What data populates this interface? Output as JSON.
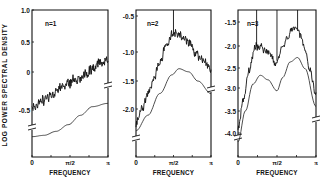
{
  "chart_data": [
    {
      "type": "line",
      "panel_label": "n=1",
      "xlabel": "FREQUENCY",
      "ylabel": "LOG POWER SPECTRAL DENSITY",
      "x_ticks": [
        "0",
        "π/2",
        "π"
      ],
      "y_ticks": [
        "1.0",
        "0.5",
        "0",
        "-0.5"
      ],
      "ylim": [
        -0.75,
        1.0
      ],
      "series": [
        {
          "name": "estimated spectrum (noisy)",
          "x": [
            0,
            0.25,
            0.5,
            0.75,
            1.0,
            1.25,
            1.5,
            1.75,
            2.0,
            2.25,
            2.5,
            2.75,
            3.14
          ],
          "values": [
            -0.45,
            -0.42,
            -0.35,
            -0.28,
            -0.22,
            -0.15,
            -0.1,
            -0.05,
            0.0,
            0.05,
            0.1,
            0.18,
            0.28
          ]
        },
        {
          "name": "theoretical spectrum (smooth, offset)",
          "x": [
            0,
            0.5,
            1.0,
            1.5,
            2.0,
            2.5,
            3.14
          ],
          "values": [
            -0.9,
            -0.88,
            -0.82,
            -0.72,
            -0.58,
            -0.45,
            -0.4
          ]
        }
      ],
      "vertical_markers": []
    },
    {
      "type": "line",
      "panel_label": "n=2",
      "xlabel": "FREQUENCY",
      "x_ticks": [
        "0",
        "π/2",
        "π"
      ],
      "y_ticks": [
        "-0.5",
        "-1.0",
        "-1.5",
        "-2.0"
      ],
      "ylim": [
        -2.4,
        -0.45
      ],
      "series": [
        {
          "name": "estimated spectrum (noisy)",
          "x": [
            0,
            0.25,
            0.5,
            0.75,
            1.0,
            1.25,
            1.5,
            1.75,
            2.0,
            2.25,
            2.5,
            2.75,
            3.14
          ],
          "values": [
            -2.25,
            -2.0,
            -1.75,
            -1.5,
            -1.25,
            -1.0,
            -0.8,
            -0.78,
            -0.85,
            -0.95,
            -1.1,
            -1.2,
            -1.35
          ]
        },
        {
          "name": "theoretical spectrum (smooth, offset)",
          "x": [
            0,
            0.5,
            1.0,
            1.5,
            1.8,
            2.2,
            2.6,
            3.14
          ],
          "values": [
            -2.35,
            -2.1,
            -1.75,
            -1.45,
            -1.35,
            -1.4,
            -1.55,
            -1.75
          ]
        }
      ],
      "vertical_markers": [
        1.57
      ]
    },
    {
      "type": "line",
      "panel_label": "n=3",
      "xlabel": "FREQUENCY",
      "x_ticks": [
        "0",
        "π/2",
        "π"
      ],
      "y_ticks": [
        "-1.5",
        "-2.0",
        "-2.5",
        "-3.0",
        "-3.5",
        "-4.0"
      ],
      "ylim": [
        -4.3,
        -1.4
      ],
      "series": [
        {
          "name": "estimated spectrum (noisy)",
          "x": [
            0,
            0.2,
            0.45,
            0.7,
            0.9,
            1.1,
            1.3,
            1.5,
            1.6,
            1.75,
            2.0,
            2.2,
            2.35,
            2.5,
            2.7,
            2.9,
            3.14
          ],
          "values": [
            -3.9,
            -3.3,
            -2.6,
            -2.05,
            -2.05,
            -2.15,
            -2.2,
            -2.45,
            -2.35,
            -2.1,
            -1.85,
            -1.65,
            -1.6,
            -1.8,
            -2.1,
            -2.6,
            -3.1
          ]
        },
        {
          "name": "theoretical spectrum (smooth, offset)",
          "x": [
            0,
            0.3,
            0.6,
            0.9,
            1.2,
            1.57,
            1.8,
            2.1,
            2.4,
            2.7,
            3.14
          ],
          "values": [
            -4.2,
            -3.5,
            -2.9,
            -2.7,
            -2.8,
            -3.05,
            -2.75,
            -2.4,
            -2.3,
            -2.55,
            -3.4
          ]
        }
      ],
      "vertical_markers": [
        0.75,
        1.57,
        2.4
      ]
    }
  ],
  "layout": {
    "panels": [
      {
        "x0": 32,
        "x1": 108,
        "y0": 10,
        "y1": 157,
        "tick_y": [
          10,
          42,
          72,
          110
        ],
        "label_x": 45,
        "label_y": 26,
        "break_y": [
          127,
          85
        ],
        "noise_amp": 6
      },
      {
        "x0": 136,
        "x1": 211,
        "y0": 10,
        "y1": 157,
        "tick_y": [
          16,
          52,
          81,
          109
        ],
        "label_x": 147,
        "label_y": 26,
        "break_y": [
          138,
          89
        ],
        "noise_amp": 5
      },
      {
        "x0": 238,
        "x1": 316,
        "y0": 10,
        "y1": 157,
        "tick_y": [
          22,
          46,
          68,
          88,
          111,
          133
        ],
        "label_x": 247,
        "label_y": 26,
        "break_y": [
          137,
          119
        ],
        "noise_amp": 4
      }
    ]
  }
}
